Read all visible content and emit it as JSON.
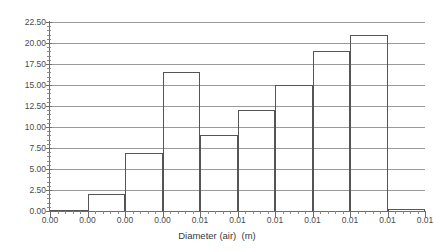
{
  "chart_data": {
    "type": "bar",
    "title": "",
    "subtitle": "",
    "xlabel": "Diameter (air)  (m)",
    "ylabel": "",
    "grid": true,
    "legend": "none",
    "categories": [
      "bin-1",
      "bin-2",
      "bin-3",
      "bin-4",
      "bin-5",
      "bin-6",
      "bin-7",
      "bin-8",
      "bin-9",
      "bin-10"
    ],
    "values": [
      0.1,
      2.0,
      6.9,
      16.5,
      9.0,
      12.0,
      15.0,
      19.0,
      21.0,
      0.2
    ],
    "ylim": [
      0.0,
      22.5
    ],
    "ytick_labels": [
      "22.50",
      "20.00",
      "17.50",
      "15.00",
      "12.50",
      "10.00",
      "7.50",
      "5.00",
      "2.50",
      "0.00"
    ],
    "ytick_values": [
      22.5,
      20.0,
      17.5,
      15.0,
      12.5,
      10.0,
      7.5,
      5.0,
      2.5,
      0.0
    ],
    "xtick_labels": [
      "0.00",
      "0.00",
      "0.00",
      "0.00",
      "0.01",
      "0.01",
      "0.01",
      "0.01",
      "0.01",
      "0.01",
      "0.01"
    ],
    "colors": {
      "bar_outline": "#555555",
      "gridline": "#9a9a9a",
      "axis": "#6b6b6b",
      "text": "#3a3a3a",
      "background": "#ffffff"
    }
  }
}
